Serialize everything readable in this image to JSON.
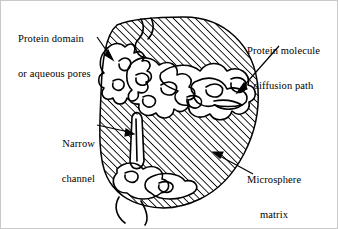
{
  "figure": {
    "type": "schematic-diagram",
    "background_color": "#ffffff",
    "ink_color": "#000000",
    "border_color": "#c9c9c9"
  },
  "labels": {
    "protein_domain": {
      "line1": "Protein domain",
      "line2": "or aqueous pores",
      "name": "protein-domain-label"
    },
    "diffusion_path": {
      "line1": "Protein molecule",
      "line2": "diffusion path",
      "name": "diffusion-path-label"
    },
    "narrow_channel": {
      "line1": "Narrow",
      "line2": "channel",
      "name": "narrow-channel-label"
    },
    "microsphere_matrix": {
      "line1": "Microsphere",
      "line2": "matrix",
      "name": "microsphere-matrix-label"
    }
  },
  "graphic": {
    "microsphere": {
      "shape": "circle",
      "hatch_angle_deg": 45,
      "hatch_spacing_px": 5.2,
      "stroke_color": "#000000"
    },
    "pores": {
      "description": "irregular white unhatched channel network inside matrix",
      "fill": "#ffffff"
    },
    "arrows": [
      {
        "name": "arrow-protein-domain",
        "from": [
          96,
          37
        ],
        "to": [
          112,
          58
        ]
      },
      {
        "name": "arrow-diffusion-path",
        "from": [
          277,
          45
        ],
        "to": [
          236,
          92
        ]
      },
      {
        "name": "arrow-narrow-channel",
        "from": [
          96,
          124
        ],
        "to": [
          133,
          133
        ]
      },
      {
        "name": "arrow-microsphere-matrix",
        "from": [
          250,
          172
        ],
        "to": [
          212,
          151
        ]
      }
    ]
  }
}
